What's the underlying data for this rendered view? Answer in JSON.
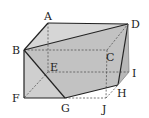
{
  "diagram": {
    "type": "cut-rectangular-prism",
    "vertices": {
      "A": {
        "label": "A",
        "x": 48,
        "y": 23,
        "lx": 44,
        "ly": 20
      },
      "B": {
        "label": "B",
        "x": 24,
        "y": 50,
        "lx": 12,
        "ly": 54
      },
      "C": {
        "label": "C",
        "x": 107,
        "y": 50,
        "lx": 106,
        "ly": 60
      },
      "D": {
        "label": "D",
        "x": 128,
        "y": 24,
        "lx": 131,
        "ly": 28
      },
      "E": {
        "label": "E",
        "x": 48,
        "y": 72,
        "lx": 50,
        "ly": 71
      },
      "F": {
        "label": "F",
        "x": 24,
        "y": 98,
        "lx": 12,
        "ly": 102
      },
      "G": {
        "label": "G",
        "x": 65,
        "y": 98,
        "lx": 61,
        "ly": 112
      },
      "H": {
        "label": "H",
        "x": 118,
        "y": 85,
        "lx": 117,
        "ly": 97
      },
      "I": {
        "label": "I",
        "x": 129,
        "y": 72,
        "lx": 132,
        "ly": 76
      },
      "J": {
        "label": "J",
        "x": 106,
        "y": 98,
        "lx": 102,
        "ly": 113
      }
    },
    "colors": {
      "face_light": "#d9d9d9",
      "face_mid": "#c4c4c4",
      "face_dark": "#b4b4b4",
      "edge": "#222222",
      "hidden_edge": "#555555"
    }
  }
}
